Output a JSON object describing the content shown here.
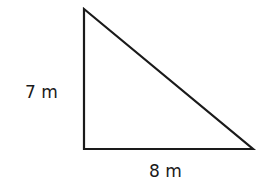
{
  "diagram": {
    "shape": "right-triangle",
    "stroke_color": "#1a1a1a",
    "vertices": {
      "top": [
        84,
        9
      ],
      "right_angle": [
        84,
        149
      ],
      "right": [
        253,
        149
      ]
    },
    "labels": {
      "height": "7 m",
      "base": "8 m"
    }
  }
}
